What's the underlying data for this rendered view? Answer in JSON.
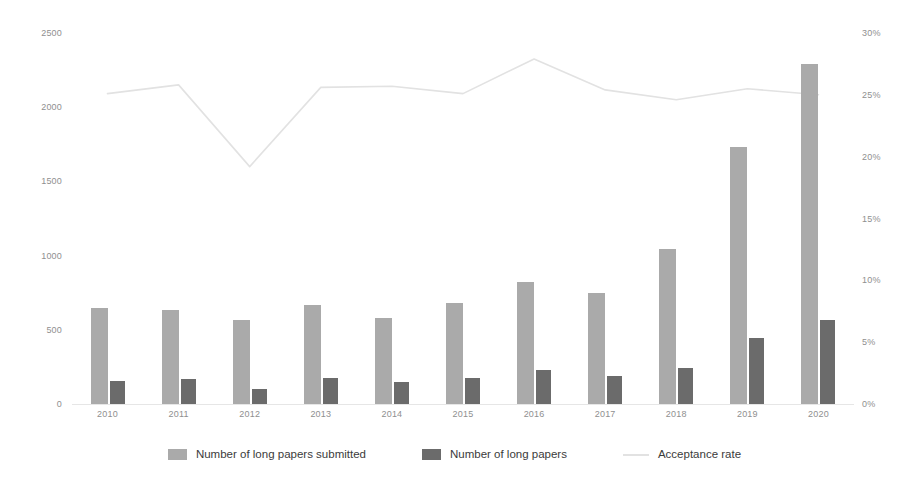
{
  "chart_data": {
    "type": "bar",
    "title": "",
    "xlabel": "",
    "ylabel": "",
    "categories": [
      "2010",
      "2011",
      "2012",
      "2013",
      "2014",
      "2015",
      "2016",
      "2017",
      "2018",
      "2019",
      "2020"
    ],
    "ylim": [
      0,
      2500
    ],
    "y_ticks": [
      "0",
      "500",
      "1000",
      "1500",
      "2000",
      "2500"
    ],
    "y_tick_values": [
      0,
      500,
      1000,
      1500,
      2000,
      2500
    ],
    "y2lim": [
      0,
      30
    ],
    "y2_ticks": [
      "0%",
      "5%",
      "10%",
      "15%",
      "20%",
      "25%",
      "30%"
    ],
    "y2_tick_values": [
      0,
      5,
      10,
      15,
      20,
      25,
      30
    ],
    "grid": false,
    "legend_position": "bottom",
    "series": [
      {
        "name": "Number of long papers submitted",
        "type": "bar",
        "axis": "left",
        "color": "#aaaaaa",
        "values": [
          647,
          634,
          566,
          667,
          580,
          680,
          822,
          748,
          1045,
          1730,
          2290
        ]
      },
      {
        "name": "Number of long papers",
        "type": "bar",
        "axis": "left",
        "color": "#6b6b6b",
        "values": [
          155,
          168,
          101,
          175,
          148,
          174,
          230,
          190,
          243,
          445,
          566
        ]
      },
      {
        "name": "Acceptance rate",
        "type": "line",
        "axis": "right",
        "color": "#e2e2e2",
        "values": [
          25.1,
          25.8,
          19.2,
          25.6,
          25.7,
          25.1,
          27.9,
          25.4,
          24.6,
          25.5,
          25.0
        ]
      }
    ]
  },
  "legend": {
    "items": [
      {
        "label": "Number of long papers submitted",
        "marker": "swatch-light"
      },
      {
        "label": "Number of long papers",
        "marker": "swatch-dark"
      },
      {
        "label": "Acceptance rate",
        "marker": "line-light"
      }
    ]
  },
  "colors": {
    "bar_submitted": "#aaaaaa",
    "bar_accepted": "#6b6b6b",
    "line_rate": "#e2e2e2",
    "axis_text": "#8f8f8f",
    "background": "#ffffff"
  }
}
